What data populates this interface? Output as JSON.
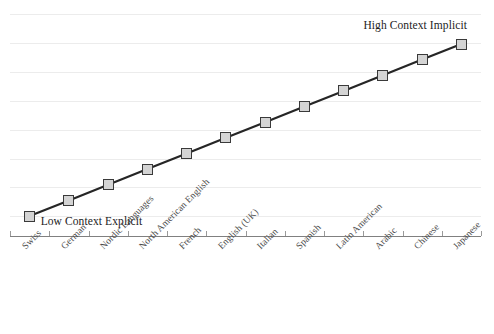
{
  "chart_data": {
    "type": "line",
    "title": "",
    "subtitle": "",
    "xlabel": "",
    "ylabel": "",
    "grid": true,
    "legend": "none",
    "categories": [
      "Swiss",
      "German",
      "Nordic Languages",
      "North American English",
      "French",
      "English (UK)",
      "Italian",
      "Spanish",
      "Latin American",
      "Arabic",
      "Chinese",
      "Japanese"
    ],
    "series": [
      {
        "name": "Context level",
        "values": [
          1,
          2,
          3,
          4,
          5,
          6,
          7,
          8,
          9,
          10,
          11,
          12
        ]
      }
    ],
    "ylim": [
      0,
      13
    ],
    "y_tick_labels": [],
    "annotations": [
      {
        "text": "Low Context Explicit",
        "x_category": "Swiss",
        "position": "bottom-left"
      },
      {
        "text": "High Context Implicit",
        "x_category": "Japanese",
        "position": "top-right"
      }
    ],
    "colors": {
      "line": "#262626",
      "marker_fill": "#d4d4d4",
      "marker_stroke": "#3a3a3a",
      "gridline": "#ececec",
      "axis": "#808080",
      "label_text": "#4a4a4a",
      "annotation_text": "#1c1c1c",
      "background": "#ffffff"
    }
  }
}
